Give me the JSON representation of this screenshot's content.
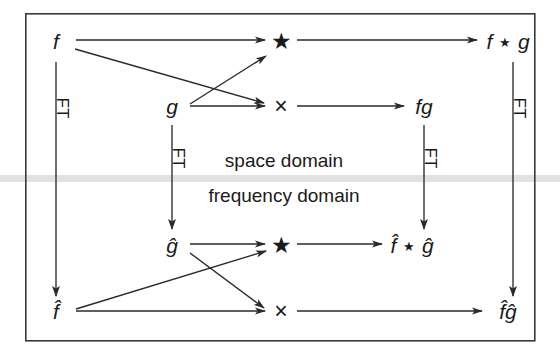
{
  "figure": {
    "frame": {
      "x": 25,
      "y": 13,
      "width": 510,
      "height": 328,
      "stroke": "#3a3a3a",
      "stroke_width": 1.6
    },
    "background_color": "#ffffff",
    "ink_color": "#1a1a1a",
    "divider_color": "#e2e2e2"
  },
  "domains": {
    "upper_label": "space domain",
    "lower_label": "frequency domain",
    "upper_label_pos": {
      "x": 284,
      "y": 160
    },
    "lower_label_pos": {
      "x": 284,
      "y": 194
    },
    "divider": {
      "y": 175,
      "height": 7
    }
  },
  "nodes": [
    {
      "id": "f",
      "label": "f",
      "x": 56,
      "y": 41,
      "kind": "function"
    },
    {
      "id": "g",
      "label": "g",
      "x": 172,
      "y": 106,
      "kind": "function"
    },
    {
      "id": "star-top",
      "label": "★",
      "x": 281,
      "y": 41,
      "kind": "operator-convolution"
    },
    {
      "id": "times-top",
      "label": "×",
      "x": 281,
      "y": 106,
      "kind": "operator-multiply"
    },
    {
      "id": "fg",
      "label": "fg",
      "x": 424,
      "y": 106,
      "kind": "result"
    },
    {
      "id": "f-conv-g",
      "label": "f ★ g",
      "x": 508,
      "y": 41,
      "kind": "result"
    },
    {
      "id": "ghat",
      "label": "ĝ",
      "x": 172,
      "y": 245,
      "kind": "function-hat"
    },
    {
      "id": "fhat",
      "label": "f̂",
      "x": 56,
      "y": 311,
      "kind": "function-hat"
    },
    {
      "id": "star-bot",
      "label": "★",
      "x": 281,
      "y": 245,
      "kind": "operator-convolution"
    },
    {
      "id": "times-bot",
      "label": "×",
      "x": 281,
      "y": 311,
      "kind": "operator-multiply"
    },
    {
      "id": "fhat-conv-ghat",
      "label": "f̂ ★ ĝ",
      "x": 412,
      "y": 245,
      "kind": "result-hat"
    },
    {
      "id": "fhat-ghat",
      "label": "f̂ĝ",
      "x": 508,
      "y": 311,
      "kind": "result-hat"
    }
  ],
  "ft_arrows": [
    {
      "id": "ft-f",
      "label": "FT",
      "from": "f",
      "to": "fhat",
      "x": 56,
      "y1": 62,
      "y2": 296,
      "label_x": 59,
      "label_y": 108
    },
    {
      "id": "ft-g",
      "label": "FT",
      "from": "g",
      "to": "ghat",
      "x": 172,
      "y1": 125,
      "y2": 229,
      "label_x": 175,
      "label_y": 158
    },
    {
      "id": "ft-fg",
      "label": "FT",
      "from": "fg",
      "to": "fhat-ghat-target",
      "x": 424,
      "y1": 125,
      "y2": 229,
      "label_x": 427,
      "label_y": 158
    },
    {
      "id": "ft-conv",
      "label": "FT",
      "from": "f-conv-g",
      "to": "fhat-ghat",
      "x": 513,
      "y1": 62,
      "y2": 296,
      "label_x": 516,
      "label_y": 108
    }
  ],
  "edges": [
    {
      "id": "f-to-star",
      "from": "f",
      "to": "star-top",
      "x1": 76,
      "y1": 40,
      "x2": 265,
      "y2": 40
    },
    {
      "id": "f-to-times",
      "from": "f",
      "to": "times-top",
      "x1": 74,
      "y1": 48,
      "x2": 265,
      "y2": 103
    },
    {
      "id": "g-to-star",
      "from": "g",
      "to": "star-top",
      "x1": 190,
      "y1": 103,
      "x2": 266,
      "y2": 57
    },
    {
      "id": "g-to-times",
      "from": "g",
      "to": "times-top",
      "x1": 190,
      "y1": 106,
      "x2": 265,
      "y2": 106
    },
    {
      "id": "star-to-fconvg",
      "from": "star-top",
      "to": "f-conv-g",
      "x1": 297,
      "y1": 40,
      "x2": 477,
      "y2": 40
    },
    {
      "id": "times-to-fg",
      "from": "times-top",
      "to": "fg",
      "x1": 297,
      "y1": 106,
      "x2": 404,
      "y2": 106
    },
    {
      "id": "ghat-to-star",
      "from": "ghat",
      "to": "star-bot",
      "x1": 190,
      "y1": 244,
      "x2": 265,
      "y2": 244
    },
    {
      "id": "ghat-to-times",
      "from": "ghat",
      "to": "times-bot",
      "x1": 189,
      "y1": 252,
      "x2": 265,
      "y2": 308
    },
    {
      "id": "fhat-to-star",
      "from": "fhat",
      "to": "star-bot",
      "x1": 76,
      "y1": 309,
      "x2": 266,
      "y2": 250
    },
    {
      "id": "fhat-to-times",
      "from": "fhat",
      "to": "times-bot",
      "x1": 76,
      "y1": 311,
      "x2": 265,
      "y2": 311
    },
    {
      "id": "star-to-fhatconv",
      "from": "star-bot",
      "to": "fhat-conv-ghat",
      "x1": 297,
      "y1": 244,
      "x2": 382,
      "y2": 244
    },
    {
      "id": "times-to-fhatghat",
      "from": "times-bot",
      "to": "fhat-ghat",
      "x1": 297,
      "y1": 311,
      "x2": 482,
      "y2": 311
    }
  ],
  "legend": {
    "convolution_symbol": "★",
    "multiplication_symbol": "×",
    "transform_label": "FT"
  }
}
